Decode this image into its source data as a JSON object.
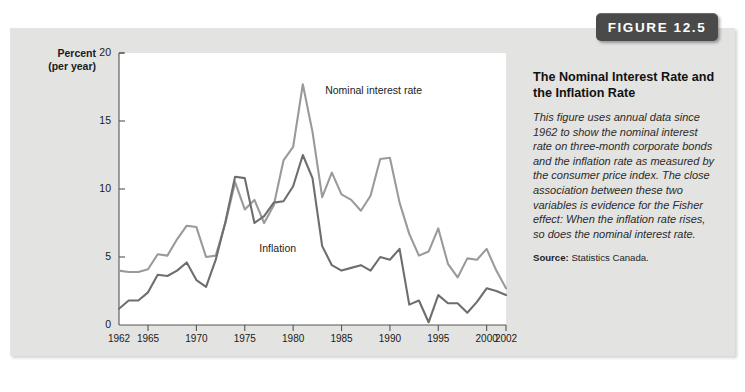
{
  "badge": {
    "label": "FIGURE 12.5"
  },
  "caption": {
    "title": "The Nominal Interest Rate and the Inflation Rate",
    "body": "This figure uses annual data since 1962 to show the nominal interest rate on three-month corporate bonds and the inflation rate as measured by the consumer price index. The close association between these two variables is evidence for the Fisher effect: When the inflation rate rises, so does the nominal interest rate.",
    "source_label": "Source:",
    "source_value": "Statistics Canada."
  },
  "chart_data": {
    "type": "line",
    "title": "The Nominal Interest Rate and the Inflation Rate",
    "xlabel": "",
    "ylabel": "Percent (per year)",
    "ylabel_line1": "Percent",
    "ylabel_line2": "(per year)",
    "xlim": [
      1962,
      2002
    ],
    "ylim": [
      0,
      20
    ],
    "yticks": [
      0,
      5,
      10,
      15,
      20
    ],
    "xticks": [
      1962,
      1965,
      1970,
      1975,
      1980,
      1985,
      1990,
      1995,
      2000,
      2002
    ],
    "grid": false,
    "legend": "inline-annotations",
    "colors": {
      "nominal": "#9a9a9a",
      "inflation": "#6e6e6e",
      "axis": "#555555",
      "plot_bg": "#ffffff",
      "panel_bg": "#e3e3e1",
      "badge_bg": "#4a4a4a"
    },
    "x": [
      1962,
      1963,
      1964,
      1965,
      1966,
      1967,
      1968,
      1969,
      1970,
      1971,
      1972,
      1973,
      1974,
      1975,
      1976,
      1977,
      1978,
      1979,
      1980,
      1981,
      1982,
      1983,
      1984,
      1985,
      1986,
      1987,
      1988,
      1989,
      1990,
      1991,
      1992,
      1993,
      1994,
      1995,
      1996,
      1997,
      1998,
      1999,
      2000,
      2001,
      2002
    ],
    "series": [
      {
        "name": "Nominal interest rate",
        "color": "#9a9a9a",
        "annotation": "Nominal interest rate",
        "values": [
          4.0,
          3.9,
          3.9,
          4.1,
          5.2,
          5.1,
          6.3,
          7.3,
          7.2,
          5.0,
          5.1,
          7.5,
          10.5,
          8.5,
          9.2,
          7.5,
          8.8,
          12.1,
          13.1,
          17.7,
          14.2,
          9.4,
          11.2,
          9.6,
          9.2,
          8.4,
          9.5,
          12.2,
          12.3,
          9.0,
          6.7,
          5.1,
          5.4,
          7.1,
          4.5,
          3.5,
          4.9,
          4.8,
          5.6,
          4.0,
          2.7
        ]
      },
      {
        "name": "Inflation",
        "color": "#6e6e6e",
        "annotation": "Inflation",
        "values": [
          1.2,
          1.8,
          1.8,
          2.4,
          3.7,
          3.6,
          4.0,
          4.6,
          3.3,
          2.8,
          4.8,
          7.6,
          10.9,
          10.8,
          7.5,
          8.0,
          9.0,
          9.1,
          10.2,
          12.5,
          10.8,
          5.8,
          4.4,
          4.0,
          4.2,
          4.4,
          4.0,
          5.0,
          4.8,
          5.6,
          1.5,
          1.8,
          0.2,
          2.2,
          1.6,
          1.6,
          0.9,
          1.7,
          2.7,
          2.5,
          2.2
        ]
      }
    ]
  }
}
